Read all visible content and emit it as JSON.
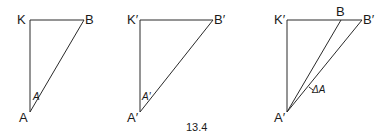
{
  "caption": "13.4",
  "figures": [
    {
      "name": "triangle-1",
      "labels": {
        "top_left": "K",
        "top_right": "B",
        "bottom": "A",
        "angle": "A"
      }
    },
    {
      "name": "triangle-2",
      "labels": {
        "top_left": "K′",
        "top_right": "B′",
        "bottom": "A′",
        "angle": "A′"
      }
    },
    {
      "name": "triangle-3",
      "labels": {
        "top_left": "K′",
        "top_mid": "B",
        "top_right": "B′",
        "bottom": "A′",
        "angle": "ΔA"
      }
    }
  ]
}
